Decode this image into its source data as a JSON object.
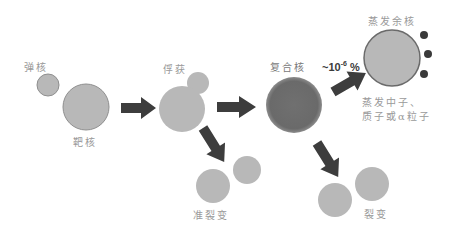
{
  "diagram": {
    "title": "",
    "colors": {
      "nucleus_fill": "#b8b8b8",
      "nucleus_stroke": "#9a9a9a",
      "compound_fill": "#6e6e6e",
      "arrow": "#3d3d3d",
      "dot": "#3a3a3a",
      "label": "#9a9a9a"
    },
    "labels": {
      "projectile": "弹核",
      "target": "靶核",
      "capture": "俘获",
      "compound_nucleus": "复合核",
      "evaporation_residue": "蒸发余核",
      "evaporate_line1": "蒸发中子、",
      "evaporate_line2": "质子或α粒子",
      "quasi_fission": "准裂变",
      "fission": "裂变",
      "probability_prefix": "~10",
      "probability_exp": "-6",
      "probability_suffix": " %"
    },
    "nodes": [
      {
        "id": "projectile",
        "label": "弹核"
      },
      {
        "id": "target",
        "label": "靶核"
      },
      {
        "id": "capture",
        "label": "俘获"
      },
      {
        "id": "compound",
        "label": "复合核"
      },
      {
        "id": "residue",
        "label": "蒸发余核"
      },
      {
        "id": "quasi-fission",
        "label": "准裂变"
      },
      {
        "id": "fission",
        "label": "裂变"
      }
    ],
    "edges": [
      {
        "from": "projectile+target",
        "to": "capture"
      },
      {
        "from": "capture",
        "to": "compound"
      },
      {
        "from": "capture",
        "to": "quasi-fission"
      },
      {
        "from": "compound",
        "to": "residue",
        "label": "~10^-6 %"
      },
      {
        "from": "compound",
        "to": "fission"
      }
    ]
  }
}
